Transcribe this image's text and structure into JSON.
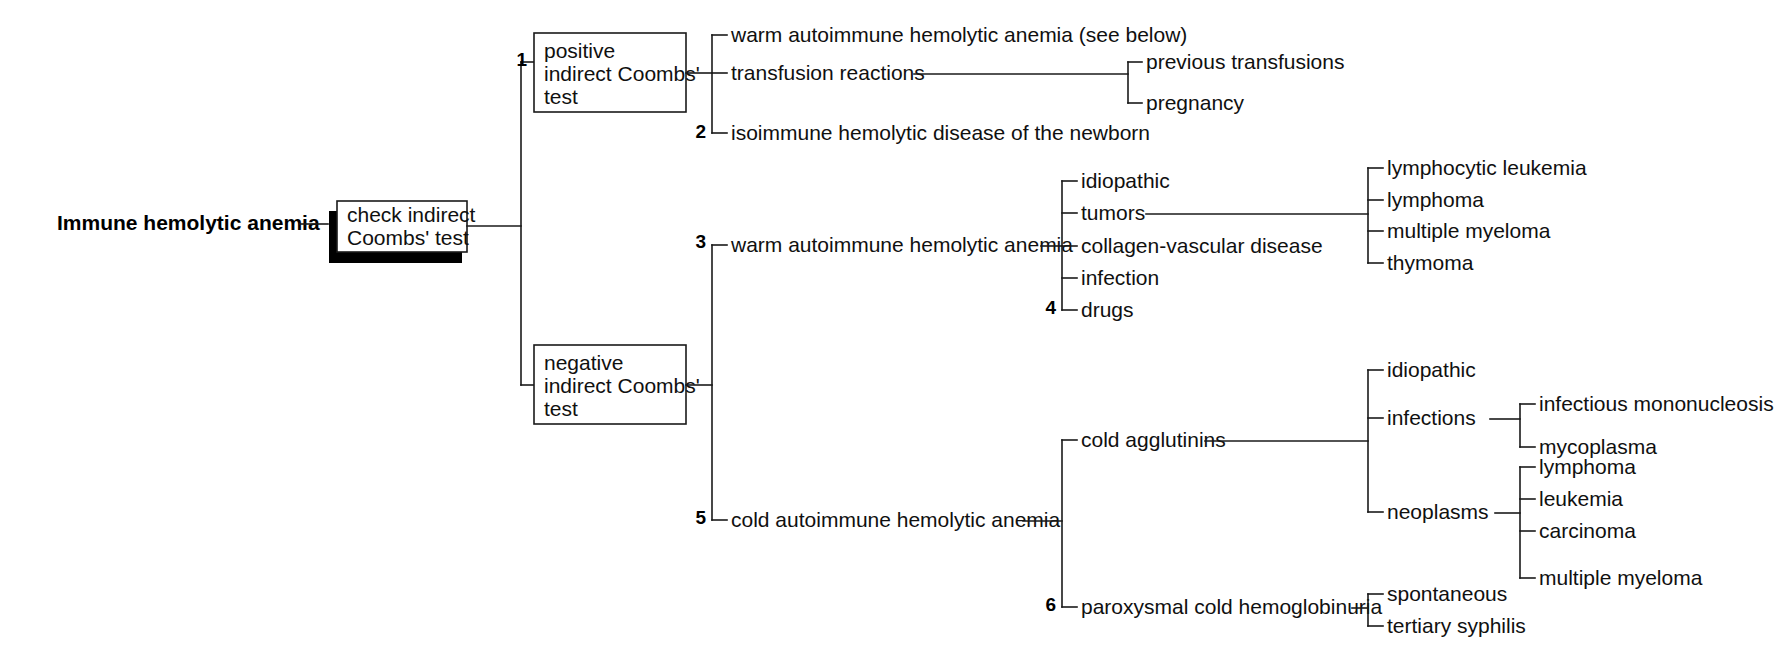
{
  "diagram": {
    "type": "decision-tree",
    "title": "Immune hemolytic anemia",
    "root": {
      "label": "Immune hemolytic anemia"
    },
    "decision_box": {
      "line1": "check indirect",
      "line2": "Coombs' test"
    },
    "branches": {
      "positive": {
        "number": "1",
        "line1": "positive",
        "line2": "indirect Coombs'",
        "line3": "test",
        "children": [
          {
            "label": "warm autoimmune hemolytic anemia (see below)",
            "number": ""
          },
          {
            "label": "transfusion reactions",
            "number": "",
            "children": [
              {
                "label": "previous transfusions"
              },
              {
                "label": "pregnancy"
              }
            ]
          },
          {
            "label": "isoimmune hemolytic disease of the newborn",
            "number": "2"
          }
        ]
      },
      "negative": {
        "line1": "negative",
        "line2": "indirect Coombs'",
        "line3": "test",
        "children": [
          {
            "number": "3",
            "label": "warm autoimmune hemolytic anemia",
            "children": [
              {
                "label": "idiopathic",
                "number": ""
              },
              {
                "label": "tumors",
                "number": "",
                "children": [
                  {
                    "label": "lymphocytic leukemia"
                  },
                  {
                    "label": "lymphoma"
                  },
                  {
                    "label": "multiple myeloma"
                  },
                  {
                    "label": "thymoma"
                  }
                ]
              },
              {
                "label": "collagen-vascular disease",
                "number": ""
              },
              {
                "label": "infection",
                "number": ""
              },
              {
                "label": "drugs",
                "number": "4"
              }
            ]
          },
          {
            "number": "5",
            "label": "cold autoimmune hemolytic anemia",
            "children": [
              {
                "label": "cold agglutinins",
                "number": "",
                "children": [
                  {
                    "label": "idiopathic",
                    "children": []
                  },
                  {
                    "label": "infections",
                    "children": [
                      {
                        "label": "infectious mononucleosis"
                      },
                      {
                        "label": "mycoplasma"
                      }
                    ]
                  },
                  {
                    "label": "neoplasms",
                    "children": [
                      {
                        "label": "lymphoma"
                      },
                      {
                        "label": "leukemia"
                      },
                      {
                        "label": "carcinoma"
                      },
                      {
                        "label": "multiple myeloma"
                      }
                    ]
                  }
                ]
              },
              {
                "label": "paroxysmal cold hemoglobinuria",
                "number": "6",
                "children": [
                  {
                    "label": "spontaneous"
                  },
                  {
                    "label": "tertiary syphilis"
                  }
                ]
              }
            ]
          }
        ]
      }
    },
    "colors": {
      "line": "#1a1a1a",
      "text": "#101010",
      "background": "#ffffff",
      "shadow": "#000000"
    }
  }
}
